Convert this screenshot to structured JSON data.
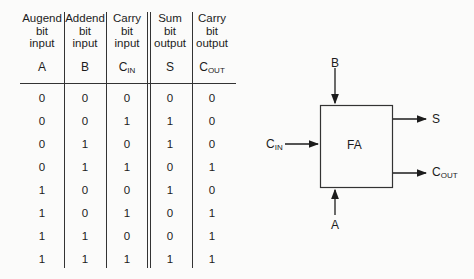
{
  "table": {
    "columns": [
      {
        "header": [
          "Augend",
          "bit",
          "input"
        ],
        "symbol": "A",
        "sub": ""
      },
      {
        "header": [
          "Addend",
          "bit",
          "input"
        ],
        "symbol": "B",
        "sub": ""
      },
      {
        "header": [
          "Carry",
          "bit",
          "input"
        ],
        "symbol": "C",
        "sub": "IN"
      },
      {
        "header": [
          "Sum",
          "bit",
          "output"
        ],
        "symbol": "S",
        "sub": ""
      },
      {
        "header": [
          "Carry",
          "bit",
          "output"
        ],
        "symbol": "C",
        "sub": "OUT"
      }
    ],
    "rows": [
      [
        "0",
        "0",
        "0",
        "0",
        "0"
      ],
      [
        "0",
        "0",
        "1",
        "1",
        "0"
      ],
      [
        "0",
        "1",
        "0",
        "1",
        "0"
      ],
      [
        "0",
        "1",
        "1",
        "0",
        "1"
      ],
      [
        "1",
        "0",
        "0",
        "1",
        "0"
      ],
      [
        "1",
        "0",
        "1",
        "0",
        "1"
      ],
      [
        "1",
        "1",
        "0",
        "0",
        "1"
      ],
      [
        "1",
        "1",
        "1",
        "1",
        "1"
      ]
    ]
  },
  "diagram": {
    "block_label": "FA",
    "inputs": {
      "b": {
        "label": "B",
        "sub": ""
      },
      "a": {
        "label": "A",
        "sub": ""
      },
      "cin": {
        "label": "C",
        "sub": "IN"
      }
    },
    "outputs": {
      "s": {
        "label": "S",
        "sub": ""
      },
      "cout": {
        "label": "C",
        "sub": "OUT"
      }
    }
  }
}
